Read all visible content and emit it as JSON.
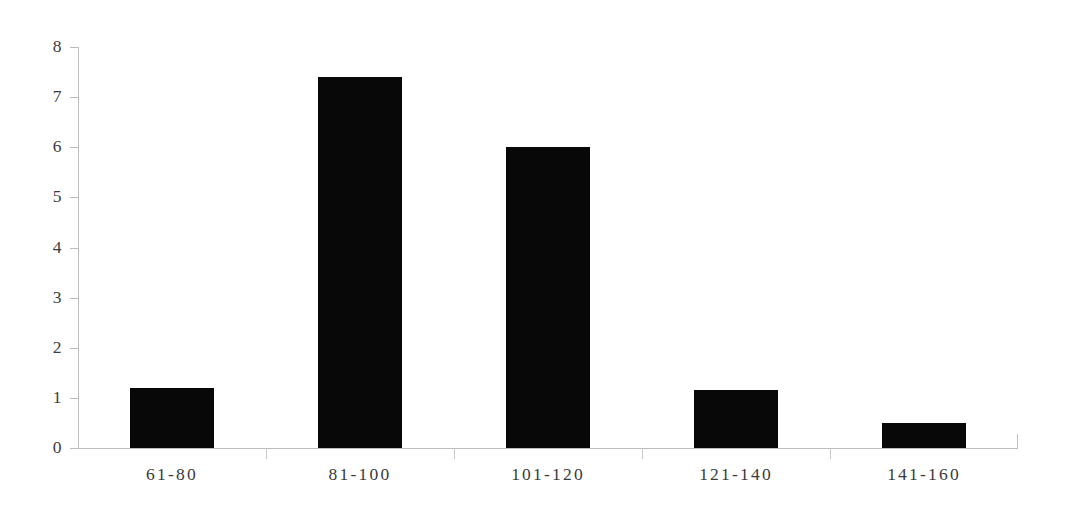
{
  "chart_data": {
    "type": "bar",
    "title": "",
    "subtitle": "",
    "xlabel": "",
    "ylabel": "",
    "categories": [
      "61-80",
      "81-100",
      "101-120",
      "121-140",
      "141-160"
    ],
    "values": [
      1.2,
      7.4,
      6.0,
      1.15,
      0.5
    ],
    "series": [
      {
        "name": "Frequency",
        "values": [
          1.2,
          7.4,
          6.0,
          1.15,
          0.5
        ]
      }
    ],
    "ylim": [
      0,
      8
    ],
    "yticks": [
      0,
      1,
      2,
      3,
      4,
      5,
      6,
      7,
      8
    ],
    "ytick_labels": [
      "0",
      "1",
      "2",
      "3",
      "4",
      "5",
      "6",
      "7",
      "8"
    ],
    "grid": false,
    "legend": false,
    "legend_position": "none",
    "annotations": [],
    "bar_color": "#080808",
    "axis_color": "#bcbcbc",
    "label_color": "#3a3a3a",
    "background_color": "#ffffff"
  }
}
